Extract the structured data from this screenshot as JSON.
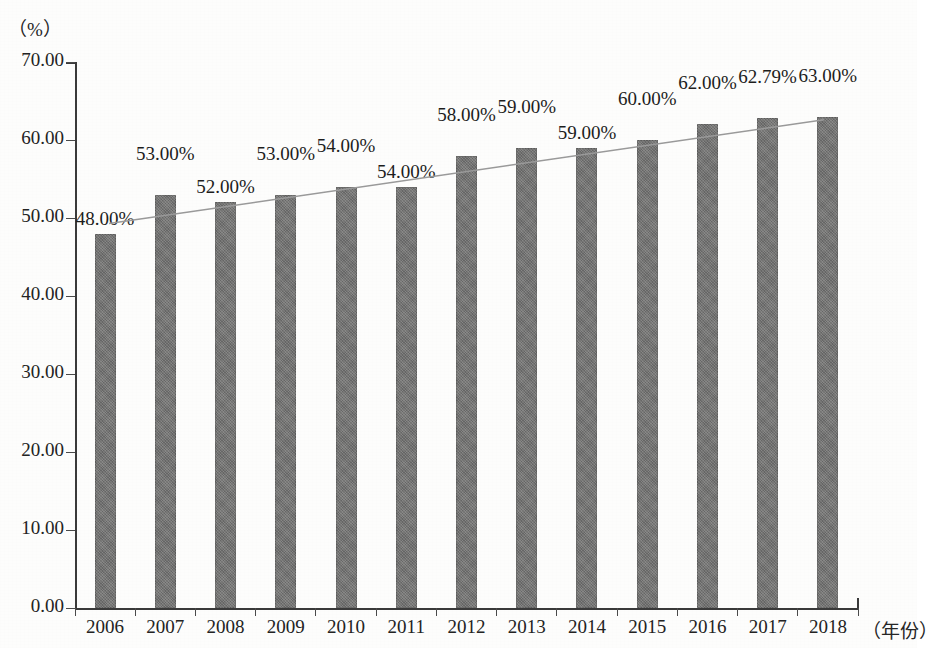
{
  "chart_data": {
    "type": "bar",
    "title": "",
    "subtitle": "",
    "xlabel": "（年份）",
    "ylabel": "（%）",
    "categories": [
      "2006",
      "2007",
      "2008",
      "2009",
      "2010",
      "2011",
      "2012",
      "2013",
      "2014",
      "2015",
      "2016",
      "2017",
      "2018"
    ],
    "values": [
      48.0,
      53.0,
      52.0,
      53.0,
      54.0,
      54.0,
      58.0,
      59.0,
      59.0,
      60.0,
      62.0,
      62.79,
      63.0
    ],
    "data_labels": [
      "48.00%",
      "53.00%",
      "52.00%",
      "53.00%",
      "54.00%",
      "54.00%",
      "58.00%",
      "59.00%",
      "59.00%",
      "60.00%",
      "62.00%",
      "62.79%",
      "63.00%"
    ],
    "ylim": [
      0,
      70
    ],
    "ytick_labels": [
      "70.00",
      "60.00",
      "50.00",
      "40.00",
      "30.00",
      "20.00",
      "10.00",
      "0.00"
    ],
    "ytick_values": [
      70,
      60,
      50,
      40,
      30,
      20,
      10,
      0
    ],
    "grid": false,
    "legend": false,
    "legend_position": "none",
    "series": [
      {
        "name": "比例",
        "values": [
          48.0,
          53.0,
          52.0,
          53.0,
          54.0,
          54.0,
          58.0,
          59.0,
          59.0,
          60.0,
          62.0,
          62.79,
          63.0
        ]
      }
    ],
    "trendline": {
      "type": "linear",
      "visible": true,
      "start_value": 49.3,
      "end_value": 62.6,
      "color": "#9a9a9a"
    },
    "colors": {
      "bar": "#70706f",
      "axis": "#3a3a3a",
      "text": "#1d1d1d",
      "trendline": "#9a9a9a"
    }
  }
}
